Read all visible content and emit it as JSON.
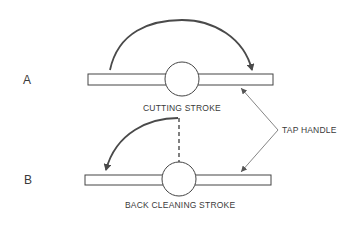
{
  "diagram": {
    "stroke_color": "#4a4a4a",
    "rows": [
      {
        "label": "A",
        "caption": "CUTTING STROKE",
        "arrow_direction": "clockwise"
      },
      {
        "label": "B",
        "caption": "BACK CLEANING STROKE",
        "arrow_direction": "counterclockwise"
      }
    ],
    "callout": {
      "label": "TAP HANDLE"
    }
  }
}
